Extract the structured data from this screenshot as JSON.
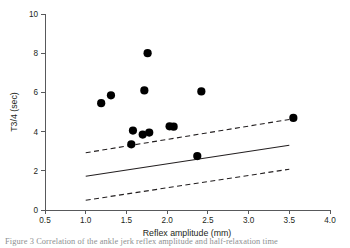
{
  "figure": {
    "caption_partial": "Figure 3  Correlation of the ankle jerk reflex amplitude and half-relaxation time"
  },
  "chart_data": {
    "type": "scatter",
    "title": "",
    "xlabel": "Reflex amplitude (mm)",
    "ylabel": "T3/4 (sec)",
    "xlim": [
      0.5,
      4.0
    ],
    "ylim": [
      0,
      10
    ],
    "xticks": [
      "0.5",
      "1.0",
      "1.5",
      "2.0",
      "2.5",
      "3.0",
      "3.5",
      "4.0"
    ],
    "xtick_values": [
      0.5,
      1.0,
      1.5,
      2.0,
      2.5,
      3.0,
      3.5,
      4.0
    ],
    "yticks": [
      "0",
      "2",
      "4",
      "6",
      "8",
      "10"
    ],
    "ytick_values": [
      0,
      2,
      4,
      6,
      8,
      10
    ],
    "grid": false,
    "legend": "none",
    "marker": "filled-circle",
    "marker_color": "#000000",
    "points": [
      {
        "x": 1.19,
        "y": 5.45
      },
      {
        "x": 1.31,
        "y": 5.85
      },
      {
        "x": 1.56,
        "y": 3.35
      },
      {
        "x": 1.58,
        "y": 4.05
      },
      {
        "x": 1.7,
        "y": 3.85
      },
      {
        "x": 1.78,
        "y": 3.95
      },
      {
        "x": 1.72,
        "y": 6.1
      },
      {
        "x": 1.76,
        "y": 8.0
      },
      {
        "x": 2.03,
        "y": 4.27
      },
      {
        "x": 2.08,
        "y": 4.25
      },
      {
        "x": 2.37,
        "y": 2.75
      },
      {
        "x": 2.42,
        "y": 6.05
      },
      {
        "x": 3.55,
        "y": 4.7
      }
    ],
    "lines": [
      {
        "name": "regression-line",
        "style": "solid",
        "color": "#231f20",
        "x": [
          1.0,
          3.5
        ],
        "y": [
          1.72,
          3.3
        ]
      },
      {
        "name": "upper-confidence-band",
        "style": "dashed",
        "color": "#231f20",
        "x": [
          1.0,
          3.5
        ],
        "y": [
          2.92,
          4.62
        ]
      },
      {
        "name": "lower-confidence-band",
        "style": "dashed",
        "color": "#231f20",
        "x": [
          1.0,
          3.5
        ],
        "y": [
          0.5,
          2.08
        ]
      }
    ]
  }
}
